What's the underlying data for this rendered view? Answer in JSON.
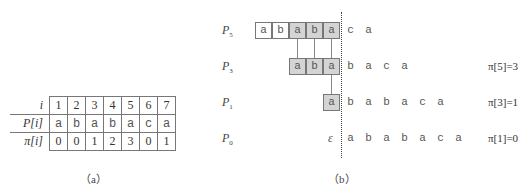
{
  "table_a": {
    "row_labels": [
      "i",
      "P[i]",
      "π[i]"
    ],
    "i": [
      "1",
      "2",
      "3",
      "4",
      "5",
      "6",
      "7"
    ],
    "P": [
      "a",
      "b",
      "a",
      "b",
      "a",
      "c",
      "a"
    ],
    "pi": [
      "0",
      "0",
      "1",
      "2",
      "3",
      "0",
      "1"
    ],
    "caption": "（a）"
  },
  "diagram_b": {
    "caption": "（b）",
    "rows": [
      {
        "label": "P",
        "sub": "5",
        "boxes": [
          "a",
          "b",
          "a",
          "b",
          "a"
        ],
        "rest": [
          "c",
          "a"
        ],
        "value": ""
      },
      {
        "label": "P",
        "sub": "3",
        "boxes": [
          "a",
          "b",
          "a"
        ],
        "rest": [
          "b",
          "a",
          "c",
          "a"
        ],
        "value": "π[5]=3"
      },
      {
        "label": "P",
        "sub": "1",
        "boxes": [
          "a"
        ],
        "rest": [
          "b",
          "a",
          "b",
          "a",
          "c",
          "a"
        ],
        "value": "π[3]=1"
      },
      {
        "label": "P",
        "sub": "0",
        "epsilon": "ε",
        "rest": [
          "a",
          "b",
          "a",
          "b",
          "a",
          "c",
          "a"
        ],
        "value": "π[1]=0"
      }
    ]
  }
}
